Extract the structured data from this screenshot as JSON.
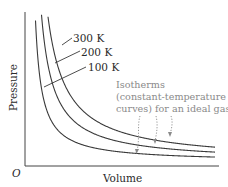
{
  "diagram": {
    "type": "pressure-volume isotherm diagram",
    "x_axis_label": "Volume",
    "y_axis_label": "Pressure",
    "origin_label": "O",
    "isotherms": [
      {
        "label": "100 K",
        "temperature_K": 100
      },
      {
        "label": "200 K",
        "temperature_K": 200
      },
      {
        "label": "300 K",
        "temperature_K": 300
      }
    ],
    "annotation": {
      "lines": [
        "Isotherms",
        "(constant-temperature",
        "curves) for an ideal gas"
      ]
    },
    "colors": {
      "curve": "#3a3a3a",
      "annotation": "#8a8a8a"
    }
  }
}
